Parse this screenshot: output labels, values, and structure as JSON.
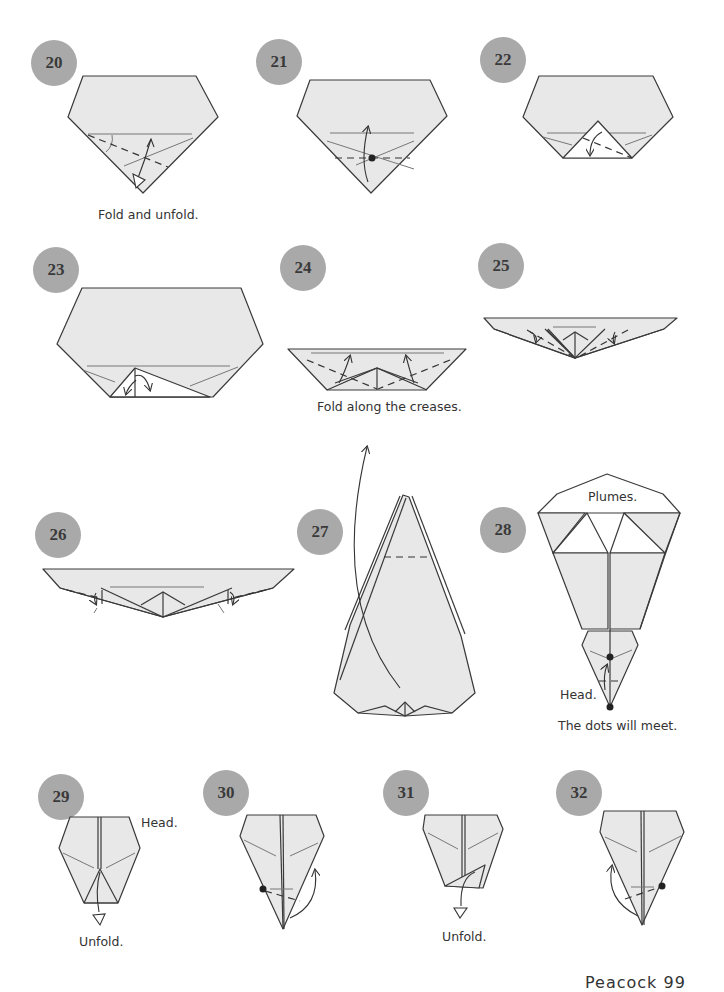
{
  "page": {
    "type": "origami instructions",
    "footer_text": "Peacock   99"
  },
  "steps": [
    {
      "number": "20",
      "caption": "Fold and unfold."
    },
    {
      "number": "21",
      "caption": ""
    },
    {
      "number": "22",
      "caption": ""
    },
    {
      "number": "23",
      "caption": ""
    },
    {
      "number": "24",
      "caption": "Fold along the creases."
    },
    {
      "number": "25",
      "caption": ""
    },
    {
      "number": "26",
      "caption": ""
    },
    {
      "number": "27",
      "caption": ""
    },
    {
      "number": "28",
      "caption": "The dots will meet.",
      "labels": [
        "Plumes.",
        "Head."
      ]
    },
    {
      "number": "29",
      "caption": "Unfold.",
      "labels": [
        "Head."
      ]
    },
    {
      "number": "30",
      "caption": ""
    },
    {
      "number": "31",
      "caption": "Unfold."
    },
    {
      "number": "32",
      "caption": ""
    }
  ],
  "colors": {
    "badge": "#a9a9a9",
    "paper": "#e8e8e8",
    "line": "#3a3a3a"
  }
}
